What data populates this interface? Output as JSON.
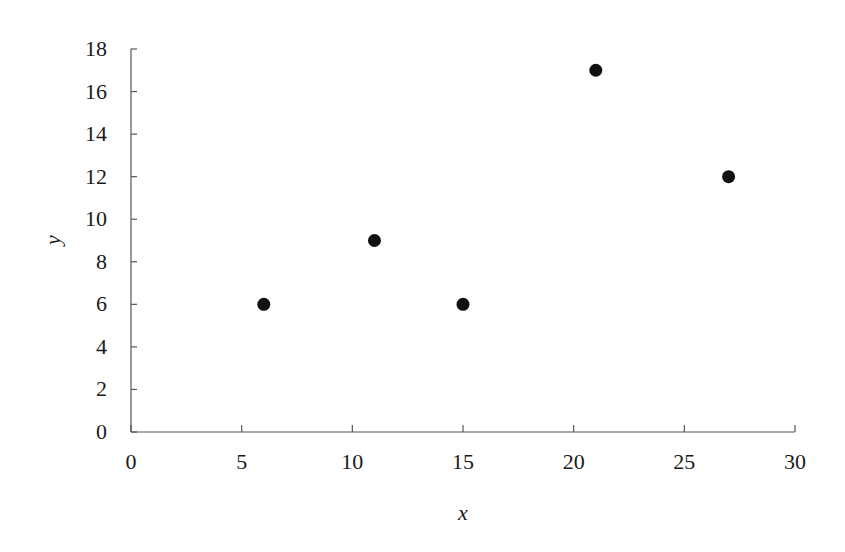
{
  "chart_data": {
    "type": "scatter",
    "title": "",
    "xlabel": "x",
    "ylabel": "y",
    "xlim": [
      0,
      30
    ],
    "ylim": [
      0,
      18
    ],
    "xticks": [
      0,
      5,
      10,
      15,
      20,
      25,
      30
    ],
    "yticks": [
      0,
      2,
      4,
      6,
      8,
      10,
      12,
      14,
      16,
      18
    ],
    "grid": false,
    "legend": null,
    "series": [
      {
        "name": "data",
        "marker": "filled-circle",
        "color": "#111111",
        "points": [
          {
            "x": 6,
            "y": 6
          },
          {
            "x": 11,
            "y": 9
          },
          {
            "x": 15,
            "y": 6
          },
          {
            "x": 21,
            "y": 17
          },
          {
            "x": 27,
            "y": 12
          }
        ]
      }
    ]
  }
}
